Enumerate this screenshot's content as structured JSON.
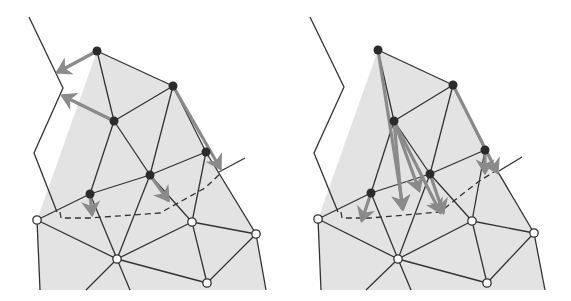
{
  "diagram": {
    "panels": [
      {
        "name": "left-panel",
        "fill": [
          [
            37,
            220
          ],
          [
            97,
            51
          ],
          [
            173,
            86
          ],
          [
            206,
            152
          ],
          [
            256,
            234
          ],
          [
            266,
            290
          ],
          [
            40,
            290
          ]
        ],
        "free_vertices": [
          [
            97,
            51
          ],
          [
            173,
            86
          ],
          [
            114,
            121
          ],
          [
            206,
            152
          ],
          [
            150,
            175
          ],
          [
            90,
            194
          ]
        ],
        "fixed_vertices": [
          [
            37,
            220
          ],
          [
            117,
            259
          ],
          [
            192,
            222
          ],
          [
            256,
            234
          ],
          [
            207,
            283
          ]
        ],
        "edges": [
          [
            [
              97,
              51
            ],
            [
              173,
              86
            ]
          ],
          [
            [
              97,
              51
            ],
            [
              114,
              121
            ]
          ],
          [
            [
              173,
              86
            ],
            [
              114,
              121
            ]
          ],
          [
            [
              173,
              86
            ],
            [
              150,
              175
            ]
          ],
          [
            [
              173,
              86
            ],
            [
              206,
              152
            ]
          ],
          [
            [
              114,
              121
            ],
            [
              150,
              175
            ]
          ],
          [
            [
              114,
              121
            ],
            [
              90,
              194
            ]
          ],
          [
            [
              206,
              152
            ],
            [
              150,
              175
            ]
          ],
          [
            [
              206,
              152
            ],
            [
              192,
              222
            ]
          ],
          [
            [
              206,
              152
            ],
            [
              256,
              234
            ]
          ],
          [
            [
              150,
              175
            ],
            [
              90,
              194
            ]
          ],
          [
            [
              150,
              175
            ],
            [
              192,
              222
            ]
          ],
          [
            [
              150,
              175
            ],
            [
              117,
              259
            ]
          ],
          [
            [
              90,
              194
            ],
            [
              37,
              220
            ]
          ],
          [
            [
              90,
              194
            ],
            [
              117,
              259
            ]
          ],
          [
            [
              37,
              220
            ],
            [
              117,
              259
            ]
          ],
          [
            [
              117,
              259
            ],
            [
              192,
              222
            ]
          ],
          [
            [
              192,
              222
            ],
            [
              256,
              234
            ]
          ],
          [
            [
              192,
              222
            ],
            [
              207,
              283
            ]
          ],
          [
            [
              117,
              259
            ],
            [
              207,
              283
            ]
          ],
          [
            [
              256,
              234
            ],
            [
              207,
              283
            ]
          ],
          [
            [
              37,
              220
            ],
            [
              40,
              290
            ]
          ],
          [
            [
              117,
              259
            ],
            [
              86,
              290
            ]
          ],
          [
            [
              117,
              259
            ],
            [
              130,
              290
            ]
          ],
          [
            [
              256,
              234
            ],
            [
              266,
              290
            ]
          ],
          [
            [
              219,
              172
            ],
            [
              245,
              158
            ]
          ]
        ],
        "boundary_polyline": [
          [
            29,
            17
          ],
          [
            63,
            88
          ],
          [
            34,
            153
          ],
          [
            57,
            212
          ]
        ],
        "dashed_polyline": [
          [
            60,
            212
          ],
          [
            61,
            218
          ],
          [
            90,
            218
          ],
          [
            160,
            213
          ],
          [
            205,
            188
          ],
          [
            222,
            172
          ]
        ],
        "arrows": [
          [
            [
              97,
              51
            ],
            [
              58,
              72
            ]
          ],
          [
            [
              114,
              121
            ],
            [
              63,
              96
            ]
          ],
          [
            [
              173,
              86
            ],
            [
              220,
              168
            ]
          ],
          [
            [
              150,
              175
            ],
            [
              168,
              200
            ]
          ],
          [
            [
              90,
              194
            ],
            [
              92,
              214
            ]
          ]
        ]
      },
      {
        "name": "right-panel",
        "fill": [
          [
            318,
            219
          ],
          [
            378,
            50
          ],
          [
            453,
            85
          ],
          [
            485,
            150
          ],
          [
            534,
            233
          ],
          [
            545,
            290
          ],
          [
            322,
            290
          ]
        ],
        "free_vertices": [
          [
            378,
            50
          ],
          [
            453,
            85
          ],
          [
            394,
            121
          ],
          [
            485,
            150
          ],
          [
            430,
            174
          ],
          [
            371,
            193
          ]
        ],
        "fixed_vertices": [
          [
            318,
            219
          ],
          [
            398,
            259
          ],
          [
            472,
            221
          ],
          [
            534,
            233
          ],
          [
            487,
            283
          ]
        ],
        "edges": [
          [
            [
              378,
              50
            ],
            [
              453,
              85
            ]
          ],
          [
            [
              378,
              50
            ],
            [
              394,
              121
            ]
          ],
          [
            [
              453,
              85
            ],
            [
              394,
              121
            ]
          ],
          [
            [
              453,
              85
            ],
            [
              430,
              174
            ]
          ],
          [
            [
              453,
              85
            ],
            [
              485,
              150
            ]
          ],
          [
            [
              394,
              121
            ],
            [
              430,
              174
            ]
          ],
          [
            [
              394,
              121
            ],
            [
              371,
              193
            ]
          ],
          [
            [
              485,
              150
            ],
            [
              430,
              174
            ]
          ],
          [
            [
              485,
              150
            ],
            [
              472,
              221
            ]
          ],
          [
            [
              485,
              150
            ],
            [
              534,
              233
            ]
          ],
          [
            [
              430,
              174
            ],
            [
              371,
              193
            ]
          ],
          [
            [
              430,
              174
            ],
            [
              472,
              221
            ]
          ],
          [
            [
              430,
              174
            ],
            [
              398,
              259
            ]
          ],
          [
            [
              371,
              193
            ],
            [
              318,
              219
            ]
          ],
          [
            [
              371,
              193
            ],
            [
              398,
              259
            ]
          ],
          [
            [
              318,
              219
            ],
            [
              398,
              259
            ]
          ],
          [
            [
              398,
              259
            ],
            [
              472,
              221
            ]
          ],
          [
            [
              472,
              221
            ],
            [
              534,
              233
            ]
          ],
          [
            [
              472,
              221
            ],
            [
              487,
              283
            ]
          ],
          [
            [
              398,
              259
            ],
            [
              487,
              283
            ]
          ],
          [
            [
              534,
              233
            ],
            [
              487,
              283
            ]
          ],
          [
            [
              318,
              219
            ],
            [
              321,
              290
            ]
          ],
          [
            [
              398,
              259
            ],
            [
              366,
              290
            ]
          ],
          [
            [
              398,
              259
            ],
            [
              411,
              290
            ]
          ],
          [
            [
              534,
              233
            ],
            [
              545,
              290
            ]
          ],
          [
            [
              499,
              171
            ],
            [
              522,
              157
            ]
          ]
        ],
        "boundary_polyline": [
          [
            310,
            17
          ],
          [
            344,
            87
          ],
          [
            314,
            153
          ],
          [
            338,
            212
          ]
        ],
        "dashed_polyline": [
          [
            341,
            212
          ],
          [
            342,
            218
          ],
          [
            370,
            218
          ],
          [
            440,
            212
          ],
          [
            455,
            200
          ],
          [
            478,
            182
          ],
          [
            500,
            168
          ]
        ],
        "arrows": [
          [
            [
              378,
              50
            ],
            [
              403,
              208
            ]
          ],
          [
            [
              394,
              121
            ],
            [
              402,
              208
            ]
          ],
          [
            [
              394,
              121
            ],
            [
              419,
              190
            ]
          ],
          [
            [
              394,
              121
            ],
            [
              440,
              212
            ]
          ],
          [
            [
              430,
              174
            ],
            [
              443,
              212
            ]
          ],
          [
            [
              453,
              85
            ],
            [
              497,
              172
            ]
          ],
          [
            [
              485,
              150
            ],
            [
              485,
              172
            ]
          ],
          [
            [
              371,
              193
            ],
            [
              362,
              220
            ]
          ]
        ]
      }
    ],
    "colors": {
      "fill": "#e3e3e3",
      "edge": "#333333",
      "arrow": "#8a8a8a",
      "free_vertex": "#2b2b2b",
      "fixed_vertex_fill": "#ffffff",
      "fixed_vertex_stroke": "#333333"
    }
  }
}
